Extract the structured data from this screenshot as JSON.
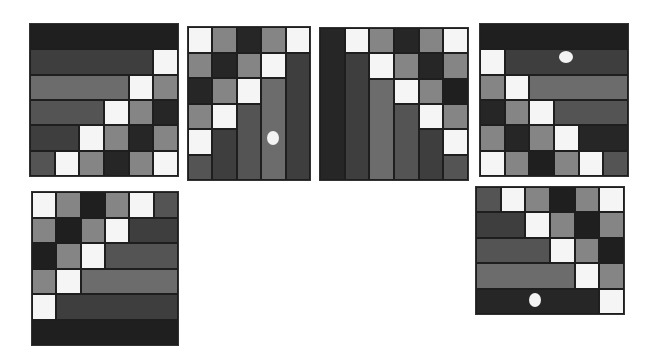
{
  "palette": {
    "W": "#f5f5f5",
    "L": "#858585",
    "G": "#6c6c6c",
    "M": "#545454",
    "D": "#3e3e3e",
    "K": "#262626",
    "N": "#1f1f1f"
  },
  "panels": [
    {
      "name": "panel-top-1",
      "x": 30,
      "y": 24,
      "w": 148,
      "h": 152,
      "cols": 6,
      "rows": 6,
      "cells": [
        {
          "c": 0,
          "r": 0,
          "cs": 6,
          "rs": 1,
          "k": "N"
        },
        {
          "c": 0,
          "r": 1,
          "cs": 5,
          "rs": 1,
          "k": "D"
        },
        {
          "c": 5,
          "r": 1,
          "cs": 1,
          "rs": 1,
          "k": "W"
        },
        {
          "c": 0,
          "r": 2,
          "cs": 4,
          "rs": 1,
          "k": "G"
        },
        {
          "c": 4,
          "r": 2,
          "cs": 1,
          "rs": 1,
          "k": "W"
        },
        {
          "c": 5,
          "r": 2,
          "cs": 1,
          "rs": 1,
          "k": "L"
        },
        {
          "c": 0,
          "r": 3,
          "cs": 3,
          "rs": 1,
          "k": "M"
        },
        {
          "c": 3,
          "r": 3,
          "cs": 1,
          "rs": 1,
          "k": "W"
        },
        {
          "c": 4,
          "r": 3,
          "cs": 1,
          "rs": 1,
          "k": "L"
        },
        {
          "c": 5,
          "r": 3,
          "cs": 1,
          "rs": 1,
          "k": "K"
        },
        {
          "c": 0,
          "r": 4,
          "cs": 2,
          "rs": 1,
          "k": "D"
        },
        {
          "c": 2,
          "r": 4,
          "cs": 1,
          "rs": 1,
          "k": "W"
        },
        {
          "c": 3,
          "r": 4,
          "cs": 1,
          "rs": 1,
          "k": "L"
        },
        {
          "c": 4,
          "r": 4,
          "cs": 1,
          "rs": 1,
          "k": "K"
        },
        {
          "c": 5,
          "r": 4,
          "cs": 1,
          "rs": 1,
          "k": "L"
        },
        {
          "c": 0,
          "r": 5,
          "cs": 1,
          "rs": 1,
          "k": "M"
        },
        {
          "c": 1,
          "r": 5,
          "cs": 1,
          "rs": 1,
          "k": "W"
        },
        {
          "c": 2,
          "r": 5,
          "cs": 1,
          "rs": 1,
          "k": "L"
        },
        {
          "c": 3,
          "r": 5,
          "cs": 1,
          "rs": 1,
          "k": "K"
        },
        {
          "c": 4,
          "r": 5,
          "cs": 1,
          "rs": 1,
          "k": "L"
        },
        {
          "c": 5,
          "r": 5,
          "cs": 1,
          "rs": 1,
          "k": "W"
        }
      ],
      "dots": []
    },
    {
      "name": "panel-top-2",
      "x": 188,
      "y": 27,
      "w": 122,
      "h": 153,
      "cols": 5,
      "rows": 6,
      "cells": [
        {
          "c": 0,
          "r": 0,
          "cs": 1,
          "rs": 1,
          "k": "W"
        },
        {
          "c": 1,
          "r": 0,
          "cs": 1,
          "rs": 1,
          "k": "L"
        },
        {
          "c": 2,
          "r": 0,
          "cs": 1,
          "rs": 1,
          "k": "K"
        },
        {
          "c": 3,
          "r": 0,
          "cs": 1,
          "rs": 1,
          "k": "L"
        },
        {
          "c": 4,
          "r": 0,
          "cs": 1,
          "rs": 1,
          "k": "W"
        },
        {
          "c": 0,
          "r": 1,
          "cs": 1,
          "rs": 1,
          "k": "L"
        },
        {
          "c": 1,
          "r": 1,
          "cs": 1,
          "rs": 1,
          "k": "K"
        },
        {
          "c": 2,
          "r": 1,
          "cs": 1,
          "rs": 1,
          "k": "L"
        },
        {
          "c": 3,
          "r": 1,
          "cs": 1,
          "rs": 1,
          "k": "W"
        },
        {
          "c": 4,
          "r": 1,
          "cs": 1,
          "rs": 5,
          "k": "D"
        },
        {
          "c": 0,
          "r": 2,
          "cs": 1,
          "rs": 1,
          "k": "K"
        },
        {
          "c": 1,
          "r": 2,
          "cs": 1,
          "rs": 1,
          "k": "L"
        },
        {
          "c": 2,
          "r": 2,
          "cs": 1,
          "rs": 1,
          "k": "W"
        },
        {
          "c": 3,
          "r": 2,
          "cs": 1,
          "rs": 4,
          "k": "G"
        },
        {
          "c": 0,
          "r": 3,
          "cs": 1,
          "rs": 1,
          "k": "L"
        },
        {
          "c": 1,
          "r": 3,
          "cs": 1,
          "rs": 1,
          "k": "W"
        },
        {
          "c": 2,
          "r": 3,
          "cs": 1,
          "rs": 3,
          "k": "M"
        },
        {
          "c": 0,
          "r": 4,
          "cs": 1,
          "rs": 1,
          "k": "W"
        },
        {
          "c": 1,
          "r": 4,
          "cs": 1,
          "rs": 2,
          "k": "D"
        },
        {
          "c": 0,
          "r": 5,
          "cs": 1,
          "rs": 1,
          "k": "M"
        }
      ],
      "dots": [
        {
          "cx": 85,
          "cy": 111,
          "rx": 6,
          "ry": 7
        }
      ]
    },
    {
      "name": "panel-top-3",
      "x": 320,
      "y": 28,
      "w": 148,
      "h": 152,
      "cols": 6,
      "rows": 6,
      "cells": [
        {
          "c": 0,
          "r": 0,
          "cs": 1,
          "rs": 6,
          "k": "K"
        },
        {
          "c": 1,
          "r": 0,
          "cs": 1,
          "rs": 1,
          "k": "W"
        },
        {
          "c": 2,
          "r": 0,
          "cs": 1,
          "rs": 1,
          "k": "L"
        },
        {
          "c": 3,
          "r": 0,
          "cs": 1,
          "rs": 1,
          "k": "K"
        },
        {
          "c": 4,
          "r": 0,
          "cs": 1,
          "rs": 1,
          "k": "L"
        },
        {
          "c": 5,
          "r": 0,
          "cs": 1,
          "rs": 1,
          "k": "W"
        },
        {
          "c": 1,
          "r": 1,
          "cs": 1,
          "rs": 5,
          "k": "D"
        },
        {
          "c": 2,
          "r": 1,
          "cs": 1,
          "rs": 1,
          "k": "W"
        },
        {
          "c": 3,
          "r": 1,
          "cs": 1,
          "rs": 1,
          "k": "L"
        },
        {
          "c": 4,
          "r": 1,
          "cs": 1,
          "rs": 1,
          "k": "K"
        },
        {
          "c": 5,
          "r": 1,
          "cs": 1,
          "rs": 1,
          "k": "L"
        },
        {
          "c": 2,
          "r": 2,
          "cs": 1,
          "rs": 4,
          "k": "G"
        },
        {
          "c": 3,
          "r": 2,
          "cs": 1,
          "rs": 1,
          "k": "W"
        },
        {
          "c": 4,
          "r": 2,
          "cs": 1,
          "rs": 1,
          "k": "L"
        },
        {
          "c": 5,
          "r": 2,
          "cs": 1,
          "rs": 1,
          "k": "N"
        },
        {
          "c": 3,
          "r": 3,
          "cs": 1,
          "rs": 3,
          "k": "M"
        },
        {
          "c": 4,
          "r": 3,
          "cs": 1,
          "rs": 1,
          "k": "W"
        },
        {
          "c": 5,
          "r": 3,
          "cs": 1,
          "rs": 1,
          "k": "L"
        },
        {
          "c": 4,
          "r": 4,
          "cs": 1,
          "rs": 2,
          "k": "D"
        },
        {
          "c": 5,
          "r": 4,
          "cs": 1,
          "rs": 1,
          "k": "W"
        },
        {
          "c": 5,
          "r": 5,
          "cs": 1,
          "rs": 1,
          "k": "M"
        }
      ],
      "dots": []
    },
    {
      "name": "panel-top-4",
      "x": 480,
      "y": 24,
      "w": 148,
      "h": 152,
      "cols": 6,
      "rows": 6,
      "cells": [
        {
          "c": 0,
          "r": 0,
          "cs": 6,
          "rs": 1,
          "k": "N"
        },
        {
          "c": 0,
          "r": 1,
          "cs": 1,
          "rs": 1,
          "k": "W"
        },
        {
          "c": 1,
          "r": 1,
          "cs": 5,
          "rs": 1,
          "k": "D"
        },
        {
          "c": 0,
          "r": 2,
          "cs": 1,
          "rs": 1,
          "k": "L"
        },
        {
          "c": 1,
          "r": 2,
          "cs": 1,
          "rs": 1,
          "k": "W"
        },
        {
          "c": 2,
          "r": 2,
          "cs": 4,
          "rs": 1,
          "k": "G"
        },
        {
          "c": 0,
          "r": 3,
          "cs": 1,
          "rs": 1,
          "k": "K"
        },
        {
          "c": 1,
          "r": 3,
          "cs": 1,
          "rs": 1,
          "k": "L"
        },
        {
          "c": 2,
          "r": 3,
          "cs": 1,
          "rs": 1,
          "k": "W"
        },
        {
          "c": 3,
          "r": 3,
          "cs": 3,
          "rs": 1,
          "k": "M"
        },
        {
          "c": 0,
          "r": 4,
          "cs": 1,
          "rs": 1,
          "k": "L"
        },
        {
          "c": 1,
          "r": 4,
          "cs": 1,
          "rs": 1,
          "k": "K"
        },
        {
          "c": 2,
          "r": 4,
          "cs": 1,
          "rs": 1,
          "k": "L"
        },
        {
          "c": 3,
          "r": 4,
          "cs": 1,
          "rs": 1,
          "k": "W"
        },
        {
          "c": 4,
          "r": 4,
          "cs": 2,
          "rs": 1,
          "k": "K"
        },
        {
          "c": 0,
          "r": 5,
          "cs": 1,
          "rs": 1,
          "k": "W"
        },
        {
          "c": 1,
          "r": 5,
          "cs": 1,
          "rs": 1,
          "k": "L"
        },
        {
          "c": 2,
          "r": 5,
          "cs": 1,
          "rs": 1,
          "k": "N"
        },
        {
          "c": 3,
          "r": 5,
          "cs": 1,
          "rs": 1,
          "k": "L"
        },
        {
          "c": 4,
          "r": 5,
          "cs": 1,
          "rs": 1,
          "k": "W"
        },
        {
          "c": 5,
          "r": 5,
          "cs": 1,
          "rs": 1,
          "k": "M"
        }
      ],
      "dots": [
        {
          "cx": 86,
          "cy": 33,
          "rx": 7,
          "ry": 6
        }
      ]
    },
    {
      "name": "panel-bottom-1",
      "x": 32,
      "y": 192,
      "w": 146,
      "h": 153,
      "cols": 6,
      "rows": 6,
      "cells": [
        {
          "c": 0,
          "r": 0,
          "cs": 1,
          "rs": 1,
          "k": "W"
        },
        {
          "c": 1,
          "r": 0,
          "cs": 1,
          "rs": 1,
          "k": "L"
        },
        {
          "c": 2,
          "r": 0,
          "cs": 1,
          "rs": 1,
          "k": "N"
        },
        {
          "c": 3,
          "r": 0,
          "cs": 1,
          "rs": 1,
          "k": "L"
        },
        {
          "c": 4,
          "r": 0,
          "cs": 1,
          "rs": 1,
          "k": "W"
        },
        {
          "c": 5,
          "r": 0,
          "cs": 1,
          "rs": 1,
          "k": "M"
        },
        {
          "c": 0,
          "r": 1,
          "cs": 1,
          "rs": 1,
          "k": "L"
        },
        {
          "c": 1,
          "r": 1,
          "cs": 1,
          "rs": 1,
          "k": "N"
        },
        {
          "c": 2,
          "r": 1,
          "cs": 1,
          "rs": 1,
          "k": "L"
        },
        {
          "c": 3,
          "r": 1,
          "cs": 1,
          "rs": 1,
          "k": "W"
        },
        {
          "c": 4,
          "r": 1,
          "cs": 2,
          "rs": 1,
          "k": "D"
        },
        {
          "c": 0,
          "r": 2,
          "cs": 1,
          "rs": 1,
          "k": "N"
        },
        {
          "c": 1,
          "r": 2,
          "cs": 1,
          "rs": 1,
          "k": "L"
        },
        {
          "c": 2,
          "r": 2,
          "cs": 1,
          "rs": 1,
          "k": "W"
        },
        {
          "c": 3,
          "r": 2,
          "cs": 3,
          "rs": 1,
          "k": "M"
        },
        {
          "c": 0,
          "r": 3,
          "cs": 1,
          "rs": 1,
          "k": "L"
        },
        {
          "c": 1,
          "r": 3,
          "cs": 1,
          "rs": 1,
          "k": "W"
        },
        {
          "c": 2,
          "r": 3,
          "cs": 4,
          "rs": 1,
          "k": "G"
        },
        {
          "c": 0,
          "r": 4,
          "cs": 1,
          "rs": 1,
          "k": "W"
        },
        {
          "c": 1,
          "r": 4,
          "cs": 5,
          "rs": 1,
          "k": "D"
        },
        {
          "c": 0,
          "r": 5,
          "cs": 6,
          "rs": 1,
          "k": "N"
        }
      ],
      "dots": []
    },
    {
      "name": "panel-bottom-2",
      "x": 476,
      "y": 187,
      "w": 148,
      "h": 127,
      "cols": 6,
      "rows": 5,
      "cells": [
        {
          "c": 0,
          "r": 0,
          "cs": 1,
          "rs": 1,
          "k": "M"
        },
        {
          "c": 1,
          "r": 0,
          "cs": 1,
          "rs": 1,
          "k": "W"
        },
        {
          "c": 2,
          "r": 0,
          "cs": 1,
          "rs": 1,
          "k": "L"
        },
        {
          "c": 3,
          "r": 0,
          "cs": 1,
          "rs": 1,
          "k": "N"
        },
        {
          "c": 4,
          "r": 0,
          "cs": 1,
          "rs": 1,
          "k": "L"
        },
        {
          "c": 5,
          "r": 0,
          "cs": 1,
          "rs": 1,
          "k": "W"
        },
        {
          "c": 0,
          "r": 1,
          "cs": 2,
          "rs": 1,
          "k": "D"
        },
        {
          "c": 2,
          "r": 1,
          "cs": 1,
          "rs": 1,
          "k": "W"
        },
        {
          "c": 3,
          "r": 1,
          "cs": 1,
          "rs": 1,
          "k": "L"
        },
        {
          "c": 4,
          "r": 1,
          "cs": 1,
          "rs": 1,
          "k": "N"
        },
        {
          "c": 5,
          "r": 1,
          "cs": 1,
          "rs": 1,
          "k": "L"
        },
        {
          "c": 0,
          "r": 2,
          "cs": 3,
          "rs": 1,
          "k": "M"
        },
        {
          "c": 3,
          "r": 2,
          "cs": 1,
          "rs": 1,
          "k": "W"
        },
        {
          "c": 4,
          "r": 2,
          "cs": 1,
          "rs": 1,
          "k": "L"
        },
        {
          "c": 5,
          "r": 2,
          "cs": 1,
          "rs": 1,
          "k": "N"
        },
        {
          "c": 0,
          "r": 3,
          "cs": 4,
          "rs": 1,
          "k": "G"
        },
        {
          "c": 4,
          "r": 3,
          "cs": 1,
          "rs": 1,
          "k": "W"
        },
        {
          "c": 5,
          "r": 3,
          "cs": 1,
          "rs": 1,
          "k": "L"
        },
        {
          "c": 0,
          "r": 4,
          "cs": 5,
          "rs": 1,
          "k": "K"
        },
        {
          "c": 5,
          "r": 4,
          "cs": 1,
          "rs": 1,
          "k": "W"
        }
      ],
      "dots": [
        {
          "cx": 59,
          "cy": 113,
          "rx": 6,
          "ry": 7
        }
      ]
    }
  ]
}
